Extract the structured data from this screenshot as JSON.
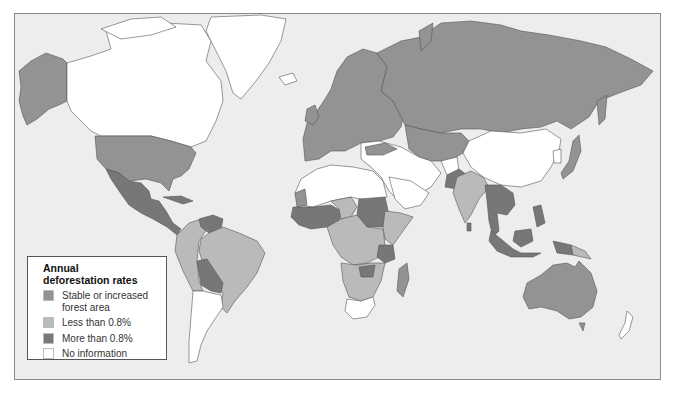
{
  "map": {
    "title": "Annual deforestation rates (world map)",
    "ocean_color": "#ededed",
    "border_color": "#555555"
  },
  "legend": {
    "title_line1": "Annual",
    "title_line2": "deforestation rates",
    "items": [
      {
        "label": "Stable or increased\nforest area",
        "color": "#939393",
        "key": "stable"
      },
      {
        "label": "Less than 0.8%",
        "color": "#bababa",
        "key": "low"
      },
      {
        "label": "More than 0.8%",
        "color": "#777777",
        "key": "high"
      },
      {
        "label": "No information",
        "color": "#ffffff",
        "key": "none"
      }
    ]
  },
  "regions": {
    "stable": [
      "Alaska",
      "United States",
      "Russia",
      "Europe",
      "Kazakhstan",
      "Central Asia",
      "Japan",
      "Australia",
      "Mongolia-border",
      "Morocco-area"
    ],
    "low": [
      "Brazil",
      "Colombia",
      "Peru",
      "Central Africa",
      "East Africa",
      "India",
      "Papua New Guinea",
      "Southern Africa"
    ],
    "high": [
      "Mexico",
      "Central America",
      "Venezuela",
      "Bolivia",
      "Paraguay",
      "West Africa",
      "Sudan",
      "Tanzania",
      "Zambia",
      "Southeast Asia",
      "Indonesia",
      "Philippines",
      "Pakistan",
      "Madagascar"
    ],
    "none": [
      "Canada",
      "Greenland",
      "China",
      "Argentina",
      "Chile",
      "North Africa",
      "Middle East",
      "South Africa",
      "New Zealand",
      "Afghanistan"
    ]
  }
}
